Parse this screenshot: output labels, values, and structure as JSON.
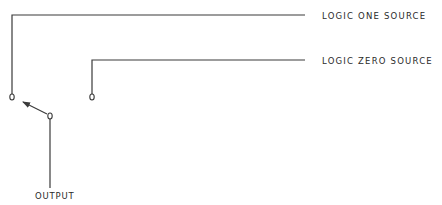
{
  "diagram": {
    "colors": {
      "line": "#3a3a3a",
      "background": "#ffffff"
    },
    "labels": {
      "logic_one": "LOGIC ONE SOURCE",
      "logic_zero": "LOGIC ZERO SOURCE",
      "output": "OUTPUT"
    },
    "nodes": [
      {
        "id": "logic-one-contact",
        "x": 12,
        "y": 97
      },
      {
        "id": "logic-zero-contact",
        "x": 92,
        "y": 97
      },
      {
        "id": "output-pivot",
        "x": 50,
        "y": 116
      }
    ],
    "connections": [
      {
        "from": "logic-one-source",
        "to": "logic-one-contact"
      },
      {
        "from": "logic-zero-source",
        "to": "logic-zero-contact"
      },
      {
        "from": "output-pivot",
        "to": "output",
        "type": "line"
      },
      {
        "from": "output-pivot",
        "to": "logic-one-contact",
        "type": "switch-arrow"
      }
    ]
  }
}
